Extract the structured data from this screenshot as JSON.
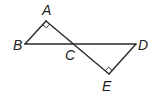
{
  "diagram": {
    "type": "geometry",
    "points": {
      "A": {
        "label": "A",
        "x": 46,
        "y": 21
      },
      "B": {
        "label": "B",
        "x": 25,
        "y": 44
      },
      "C": {
        "label": "C",
        "x": 74,
        "y": 44
      },
      "D": {
        "label": "D",
        "x": 136,
        "y": 44
      },
      "E": {
        "label": "E",
        "x": 109,
        "y": 74
      }
    },
    "segments": [
      "AB",
      "AE",
      "BD",
      "DE"
    ],
    "right_angles": [
      "A",
      "E"
    ],
    "stroke_color": "#2a2a2a"
  }
}
